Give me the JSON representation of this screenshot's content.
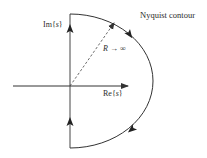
{
  "diagram": {
    "title": "Nyquist contour",
    "im_axis_label_prefix": "Im{",
    "im_axis_label_var": "s",
    "im_axis_label_suffix": "}",
    "re_axis_label_prefix": "Re{",
    "re_axis_label_var": "s",
    "re_axis_label_suffix": "}",
    "radius_label_var": "R",
    "radius_label_rest": " → ∞",
    "colors": {
      "stroke": "#333333",
      "text": "#2a2a2a",
      "background": "#ffffff"
    },
    "elements": [
      "real-axis-arrow",
      "imaginary-axis-contour-segment",
      "semicircular-arc-right-half-plane",
      "dashed-radius-arrow",
      "direction-arrows-up-imaginary-axis",
      "direction-arrows-clockwise-on-arc"
    ]
  }
}
